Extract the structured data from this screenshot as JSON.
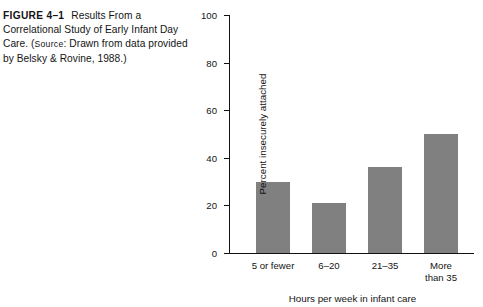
{
  "caption": {
    "figure_label": "FIGURE 4–1",
    "text_before_source": "Results From a Correlational Study of Early Infant Day Care. (",
    "source_word": "Source",
    "text_after_source": ": Drawn from data provided by Belsky & Rovine, 1988.)"
  },
  "chart_data": {
    "type": "bar",
    "title": "",
    "subtitle": "",
    "categories": [
      "5 or fewer",
      "6–20",
      "21–35",
      "More\nthan 35"
    ],
    "values": [
      30,
      21,
      36,
      50
    ],
    "xlabel": "Hours per week in infant care",
    "ylabel": "Percent insecurely attached",
    "ylim": [
      0,
      100
    ],
    "yticks": [
      0,
      20,
      40,
      60,
      80,
      100
    ],
    "ytick_labels": [
      "0",
      "20",
      "40",
      "60",
      "80",
      "100"
    ],
    "grid": false,
    "legend": false,
    "bar_color": "#808080",
    "axis_color": "#111111",
    "background": "#ffffff"
  }
}
